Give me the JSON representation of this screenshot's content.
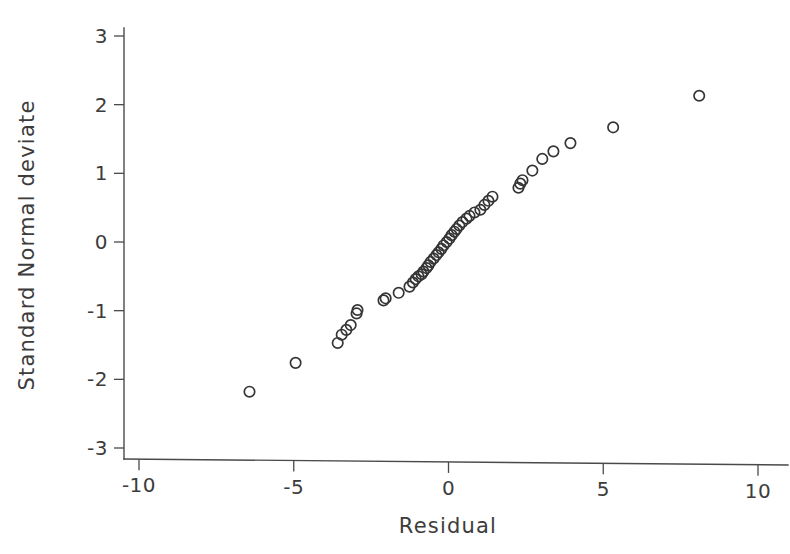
{
  "chart_data": {
    "type": "scatter",
    "title": "",
    "subtitle": "",
    "xlabel": "Residual",
    "ylabel": "Standard Normal deviate",
    "xlim": [
      -10,
      10
    ],
    "ylim": [
      -3,
      3
    ],
    "xticks": [
      -10,
      -5,
      0,
      5,
      10
    ],
    "xticklabels": [
      "-10",
      "-5",
      "0",
      "5",
      "10"
    ],
    "yticks": [
      -3,
      -2,
      -1,
      0,
      1,
      2,
      3
    ],
    "yticklabels": [
      "-3",
      "-2",
      "-1",
      "0",
      "1",
      "2",
      "3"
    ],
    "xminorticks": [],
    "yminorticks": [],
    "grid": false,
    "legend": null,
    "marker": "open-circle",
    "marker_size": 5.2,
    "marker_color": "#353535",
    "annotations": [],
    "series": [
      {
        "name": "residual-quantiles",
        "x": [
          -6.43,
          -4.94,
          -3.58,
          -3.45,
          -3.3,
          -3.16,
          -2.97,
          -2.94,
          -2.1,
          -2.03,
          -1.61,
          -1.26,
          -1.15,
          -1.06,
          -0.97,
          -0.87,
          -0.81,
          -0.71,
          -0.65,
          -0.58,
          -0.48,
          -0.39,
          -0.32,
          -0.23,
          -0.16,
          -0.06,
          0.03,
          0.1,
          0.19,
          0.26,
          0.35,
          0.45,
          0.58,
          0.68,
          0.84,
          1.03,
          1.16,
          1.29,
          1.42,
          2.26,
          2.32,
          2.39,
          2.71,
          3.03,
          3.39,
          3.94,
          5.32,
          8.1
        ],
        "y": [
          -2.18,
          -1.76,
          -1.47,
          -1.35,
          -1.28,
          -1.21,
          -1.04,
          -0.99,
          -0.85,
          -0.82,
          -0.74,
          -0.65,
          -0.59,
          -0.54,
          -0.5,
          -0.47,
          -0.43,
          -0.38,
          -0.34,
          -0.29,
          -0.24,
          -0.19,
          -0.15,
          -0.1,
          -0.05,
          0.0,
          0.05,
          0.1,
          0.15,
          0.19,
          0.24,
          0.29,
          0.34,
          0.38,
          0.43,
          0.47,
          0.54,
          0.6,
          0.66,
          0.79,
          0.85,
          0.9,
          1.04,
          1.21,
          1.32,
          1.44,
          1.67,
          2.13
        ]
      }
    ]
  }
}
